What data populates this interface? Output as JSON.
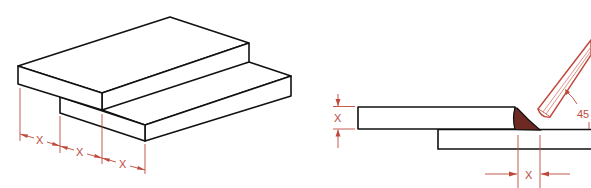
{
  "figure": {
    "left_view": {
      "description": "isometric lap joint, overlap dimensioned",
      "dimension_labels": [
        "X",
        "X",
        "X"
      ]
    },
    "right_view": {
      "description": "section view of lap fillet weld with electrode",
      "thickness_label": "X",
      "overlap_label": "X",
      "angle_label": "45"
    }
  },
  "colors": {
    "line": "#111111",
    "dimension": "#c0483a",
    "weld": "#6e2a22"
  }
}
